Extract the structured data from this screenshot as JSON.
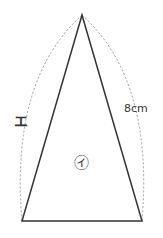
{
  "diagram": {
    "shape": "isosceles-triangle",
    "labels": {
      "side_left": "エ",
      "side_right": "8cm",
      "inner": "㋑"
    },
    "colors": {
      "stroke": "#333333",
      "dashed": "#888888"
    }
  }
}
